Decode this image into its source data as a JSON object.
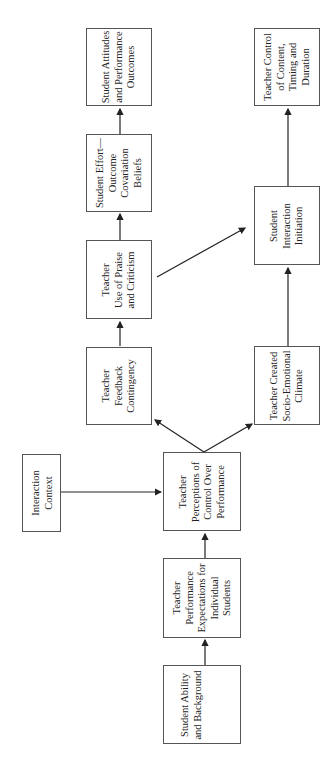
{
  "diagram": {
    "orientation": "rotated-90-ccw",
    "nodes": [
      {
        "id": "student_attitudes",
        "label": "Student Attitudes\nand Performance\nOutcomes"
      },
      {
        "id": "student_effort",
        "label": "Student Effort—\nOutcome\nCovariation\nBeliefs"
      },
      {
        "id": "praise_criticism",
        "label": "Teacher\nUse of Praise\nand Criticism"
      },
      {
        "id": "feedback_contingency",
        "label": "Teacher\nFeedback\nContingency"
      },
      {
        "id": "teacher_control",
        "label": "Teacher Control\nof Content,\nTiming and\nDuration"
      },
      {
        "id": "interaction_initiation",
        "label": "Student\nInteraction\nInitiation"
      },
      {
        "id": "socio_emotional",
        "label": "Teacher Created\nSocio-Emotional\nClimate"
      },
      {
        "id": "interaction_context",
        "label": "Interaction\nContext"
      },
      {
        "id": "perceptions_control",
        "label": "Teacher\nPerceptions of\nControl Over\nPerformance"
      },
      {
        "id": "performance_expectations",
        "label": "Teacher\nPerformance\nExpectations for\nIndividual\nStudents"
      },
      {
        "id": "student_ability",
        "label": "Student Ability\nand Background"
      }
    ],
    "edges": [
      {
        "from": "student_ability",
        "to": "performance_expectations"
      },
      {
        "from": "performance_expectations",
        "to": "perceptions_control"
      },
      {
        "from": "interaction_context",
        "to": "perceptions_control"
      },
      {
        "from": "perceptions_control",
        "to": "feedback_contingency"
      },
      {
        "from": "perceptions_control",
        "to": "socio_emotional"
      },
      {
        "from": "feedback_contingency",
        "to": "praise_criticism"
      },
      {
        "from": "praise_criticism",
        "to": "student_effort"
      },
      {
        "from": "praise_criticism",
        "to": "interaction_initiation"
      },
      {
        "from": "student_effort",
        "to": "student_attitudes"
      },
      {
        "from": "socio_emotional",
        "to": "interaction_initiation"
      },
      {
        "from": "interaction_initiation",
        "to": "teacher_control"
      }
    ]
  }
}
